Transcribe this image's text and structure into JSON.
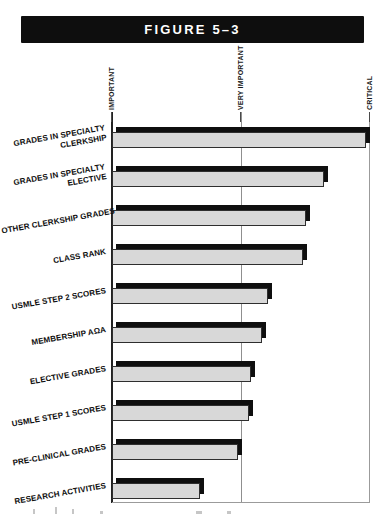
{
  "figure_header": {
    "label": "FIGURE 5–3",
    "bg": "#0e0e0e",
    "text_color": "#ffffff"
  },
  "chart_data": {
    "type": "bar",
    "orientation": "horizontal",
    "title": "FIGURE 5–3",
    "axis": {
      "position": "top",
      "tick_labels": [
        "IMPORTANT",
        "VERY IMPORTANT",
        "CRITICAL"
      ],
      "tick_values": [
        1,
        2,
        3
      ],
      "label_rotation": "vertical",
      "xlim": [
        1,
        3
      ],
      "gridlines_at": [
        2,
        3
      ]
    },
    "categories": [
      "GRADES IN SPECIALTY CLERKSHIP",
      "GRADES IN SPECIALTY ELECTIVE",
      "OTHER CLERKSHIP GRADES",
      "CLASS RANK",
      "USMLE STEP 2 SCORES",
      "MEMBERSHIP AΩA",
      "ELECTIVE GRADES",
      "USMLE STEP 1 SCORES",
      "PRE-CLINICAL GRADES",
      "RESEARCH ACTIVITIES"
    ],
    "category_label_lines": [
      [
        "GRADES IN SPECIALTY",
        "CLERKSHIP"
      ],
      [
        "GRADES IN SPECIALTY",
        "ELECTIVE"
      ],
      [
        "OTHER CLERKSHIP GRADES"
      ],
      [
        "CLASS RANK"
      ],
      [
        "USMLE STEP 2 SCORES"
      ],
      [
        "MEMBERSHIP AΩA"
      ],
      [
        "ELECTIVE GRADES"
      ],
      [
        "USMLE STEP 1 SCORES"
      ],
      [
        "PRE-CLINICAL GRADES"
      ],
      [
        "RESEARCH ACTIVITIES"
      ]
    ],
    "values": [
      2.97,
      2.64,
      2.5,
      2.48,
      2.21,
      2.16,
      2.08,
      2.06,
      1.98,
      1.68
    ],
    "bar_style": {
      "fill": "#d8d8d8",
      "border": "#2e2e2e",
      "shadow": "#0f0f0f",
      "shadow_offset": "up-right"
    },
    "grid": "vertical gridline at VERY IMPORTANT; right frame line at CRITICAL",
    "legend": "none"
  }
}
